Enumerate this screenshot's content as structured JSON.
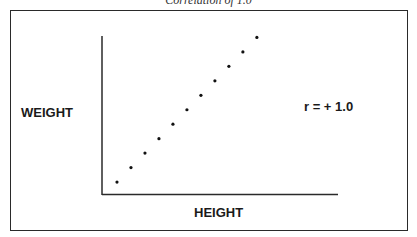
{
  "chart_data": {
    "type": "scatter",
    "title": "Correlation of 1.0",
    "xlabel": "HEIGHT",
    "ylabel": "WEIGHT",
    "annotation": "r = + 1.0",
    "x": [
      1,
      2,
      3,
      4,
      5,
      6,
      7,
      8,
      9,
      10,
      11
    ],
    "y": [
      1,
      2,
      3,
      4,
      5,
      6,
      7,
      8,
      9,
      10,
      11
    ],
    "xlim": [
      0,
      16.8
    ],
    "ylim": [
      0,
      11.1
    ],
    "grid": false,
    "ticks": false,
    "legend": "none"
  }
}
